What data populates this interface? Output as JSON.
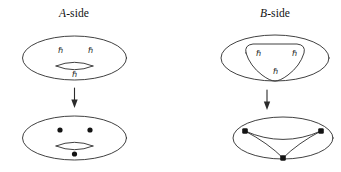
{
  "figure": {
    "background_color": "#ffffff",
    "stroke_color": "#2b2b2b",
    "dot_color": "#141414",
    "panels": {
      "a_side": {
        "title_letter": "A",
        "title_suffix": "-side",
        "title_full": "A-side",
        "top_shape": "torus",
        "bottom_shape": "torus-with-three-punctures",
        "arrow": "downward-arrow",
        "hbar_labels": [
          {
            "text": "ℏ",
            "position": "upper-left"
          },
          {
            "text": "ℏ",
            "position": "upper-right"
          },
          {
            "text": "ℏ",
            "position": "lower-center"
          }
        ],
        "dot_count": 3
      },
      "b_side": {
        "title_letter": "B",
        "title_suffix": "-side",
        "title_full": "B-side",
        "top_shape": "ellipse-with-inner-rounded-triangle",
        "bottom_shape": "ellipse-with-theta-graph",
        "arrow": "downward-arrow",
        "hbar_labels": [
          {
            "text": "ℏ",
            "position": "upper-left"
          },
          {
            "text": "ℏ",
            "position": "upper-right"
          },
          {
            "text": "ℏ",
            "position": "lower-center"
          }
        ],
        "vertex_count": 3
      }
    }
  }
}
